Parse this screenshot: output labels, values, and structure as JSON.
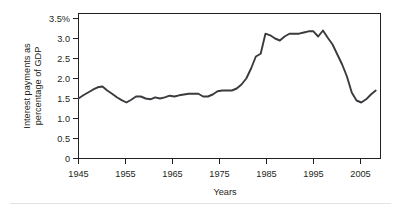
{
  "chart_data": {
    "type": "line",
    "title": "",
    "xlabel": "Years",
    "ylabel": "Interest payments as percentage of GDP",
    "ylabel_line1": "Interest payments as",
    "ylabel_line2": "percentage of GDP",
    "xlim": [
      1945,
      2008
    ],
    "ylim": [
      0,
      3.5
    ],
    "grid": false,
    "legend": "none",
    "xticks": [
      1945,
      1955,
      1965,
      1975,
      1985,
      1995,
      2005
    ],
    "xtick_labels": [
      "1945",
      "1955",
      "1965",
      "1975",
      "1985",
      "1995",
      "2005"
    ],
    "yticks": [
      0,
      0.5,
      1.0,
      1.5,
      2.0,
      2.5,
      3.0,
      3.5
    ],
    "ytick_labels": [
      "0",
      "0.5",
      "1.0",
      "1.5",
      "2.0",
      "2.5",
      "3.0",
      "3.5%"
    ],
    "line_color": "#3b3b3f",
    "axis_color": "#231f20",
    "background_color": "#ffffff",
    "series": [
      {
        "name": "Interest payments as percentage of GDP",
        "x": [
          1945,
          1946,
          1947,
          1948,
          1949,
          1950,
          1951,
          1952,
          1953,
          1954,
          1955,
          1956,
          1957,
          1958,
          1959,
          1960,
          1961,
          1962,
          1963,
          1964,
          1965,
          1966,
          1967,
          1968,
          1969,
          1970,
          1971,
          1972,
          1973,
          1974,
          1975,
          1976,
          1977,
          1978,
          1979,
          1980,
          1981,
          1982,
          1983,
          1984,
          1985,
          1986,
          1987,
          1988,
          1989,
          1990,
          1991,
          1992,
          1993,
          1994,
          1995,
          1996,
          1997,
          1998,
          1999,
          2000,
          2001,
          2002,
          2003,
          2004,
          2005,
          2006,
          2007
        ],
        "values": [
          1.5,
          1.58,
          1.65,
          1.72,
          1.78,
          1.8,
          1.7,
          1.62,
          1.53,
          1.46,
          1.4,
          1.47,
          1.55,
          1.55,
          1.5,
          1.48,
          1.53,
          1.5,
          1.53,
          1.57,
          1.55,
          1.58,
          1.6,
          1.62,
          1.62,
          1.62,
          1.55,
          1.55,
          1.6,
          1.68,
          1.7,
          1.7,
          1.7,
          1.75,
          1.85,
          2.0,
          2.25,
          2.55,
          2.62,
          3.12,
          3.08,
          3.0,
          2.95,
          3.05,
          3.12,
          3.12,
          3.12,
          3.15,
          3.18,
          3.18,
          3.05,
          3.2,
          3.02,
          2.85,
          2.6,
          2.35,
          2.05,
          1.65,
          1.45,
          1.4,
          1.48,
          1.6,
          1.7
        ]
      }
    ]
  },
  "axes": {
    "y_title_line1": "Interest payments as",
    "y_title_line2": "percentage of GDP",
    "x_title": "Years"
  }
}
